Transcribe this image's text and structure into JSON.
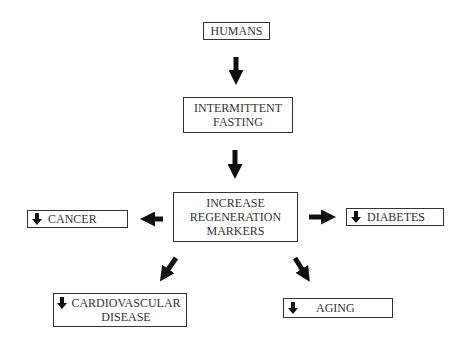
{
  "diagram": {
    "nodes": {
      "humans": {
        "label": "HUMANS"
      },
      "intermittent_fasting": {
        "label": "INTERMITTENT\nFASTING"
      },
      "regeneration": {
        "label": "INCREASE\nREGENERATION\nMARKERS"
      },
      "cancer": {
        "label": "CANCER",
        "indicator": "decrease-arrow"
      },
      "diabetes": {
        "label": "DIABETES",
        "indicator": "decrease-arrow"
      },
      "cardiovascular": {
        "label": "CARDIOVASCULAR\nDISEASE",
        "indicator": "decrease-arrow"
      },
      "aging": {
        "label": "AGING",
        "indicator": "decrease-arrow"
      }
    },
    "edges": [
      {
        "from": "humans",
        "to": "intermittent_fasting",
        "direction": "down"
      },
      {
        "from": "intermittent_fasting",
        "to": "regeneration",
        "direction": "down"
      },
      {
        "from": "regeneration",
        "to": "cancer",
        "direction": "left"
      },
      {
        "from": "regeneration",
        "to": "diabetes",
        "direction": "right"
      },
      {
        "from": "regeneration",
        "to": "cardiovascular",
        "direction": "down-left"
      },
      {
        "from": "regeneration",
        "to": "aging",
        "direction": "down-right"
      }
    ],
    "colors": {
      "border": "#333333",
      "arrow": "#111111",
      "text": "#333333",
      "background": "#ffffff"
    }
  }
}
